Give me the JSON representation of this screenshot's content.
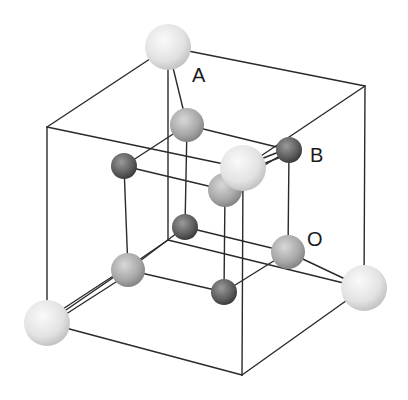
{
  "diagram": {
    "type": "crystal-unit-cell",
    "labels": [
      {
        "id": "A",
        "text": "A",
        "x": 192,
        "y": 82
      },
      {
        "id": "B",
        "text": "B",
        "x": 310,
        "y": 162
      },
      {
        "id": "O",
        "text": "O",
        "x": 307,
        "y": 246
      }
    ],
    "colors": {
      "site_A": "#e6e6e6",
      "site_O": "#a8a8a8",
      "site_B": "#5a5a5a",
      "lines": "#2a2a2a"
    },
    "outer_cube": {
      "vertices": {
        "btl": [
          168,
          47
        ],
        "btr": [
          365,
          86
        ],
        "ftl": [
          47,
          127
        ],
        "ftr": [
          243,
          168
        ],
        "bbl": [
          168,
          240
        ],
        "bbr": [
          364,
          288
        ],
        "fbl": [
          47,
          323
        ],
        "fbr": [
          242,
          375
        ]
      }
    },
    "inner_cube": {
      "vertices": {
        "tl": [
          124,
          166
        ],
        "tb": [
          187,
          125
        ],
        "tr": [
          289,
          150
        ],
        "tf": [
          225,
          190
        ],
        "bl": [
          128,
          270
        ],
        "bb": [
          185,
          227
        ],
        "br": [
          288,
          252
        ],
        "bf": [
          224,
          292
        ]
      }
    },
    "atoms": {
      "A_sites": [
        [
          168,
          47
        ],
        [
          243,
          168
        ],
        [
          47,
          323
        ],
        [
          364,
          288
        ]
      ],
      "O_sites": [
        [
          187,
          125
        ],
        [
          225,
          190
        ],
        [
          128,
          270
        ],
        [
          288,
          252
        ]
      ],
      "B_sites": [
        [
          124,
          166
        ],
        [
          289,
          150
        ],
        [
          185,
          227
        ],
        [
          224,
          292
        ]
      ]
    }
  }
}
